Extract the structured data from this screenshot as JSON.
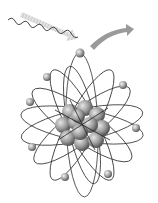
{
  "image": {
    "subject": "atom illustration (photoelectric effect)",
    "background": "#ffffff",
    "colors": {
      "orbit": "#3a3a3a",
      "nucleus_light": "#d6d6d6",
      "nucleus_dark": "#5a5a5a",
      "electron": "#a0a0a0",
      "incoming_arrow": "#d8d8d8",
      "outgoing_arrow": "#9a9a9a",
      "photon_wave": "#444444"
    },
    "elements": {
      "photon_wave": {
        "from": [
          8,
          20
        ],
        "to": [
          78,
          52
        ]
      },
      "incoming_arrow": {
        "from": [
          22,
          14
        ],
        "to": [
          75,
          38
        ]
      },
      "outgoing_arrow": {
        "from": [
          90,
          46
        ],
        "to": [
          134,
          28
        ]
      },
      "nucleus": {
        "center": [
          82,
          125
        ],
        "radius": 25
      },
      "electrons": [
        [
          80,
          53
        ],
        [
          47,
          77
        ],
        [
          123,
          85
        ],
        [
          30,
          102
        ],
        [
          136,
          128
        ],
        [
          32,
          147
        ],
        [
          108,
          174
        ],
        [
          65,
          177
        ]
      ]
    }
  }
}
